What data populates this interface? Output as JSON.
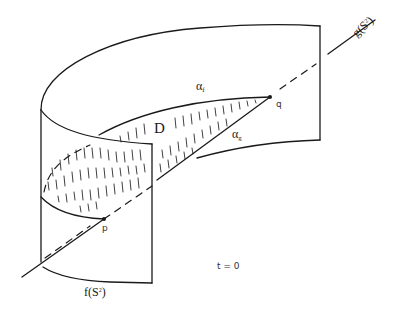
{
  "figure": {
    "labels": {
      "g_surface": {
        "main": "g(S",
        "sup": "2",
        "close": ")"
      },
      "f_surface": {
        "main": "f(S",
        "sup": "2",
        "close": ")"
      },
      "alpha_f": {
        "main": "α",
        "sub": "f"
      },
      "alpha_g": {
        "main": "α",
        "sub": "g"
      },
      "disk": "D",
      "point_p": "p",
      "point_q": "q",
      "time": "t = 0"
    },
    "colors": {
      "ink": "#1a1a1a",
      "background": "#ffffff"
    }
  }
}
